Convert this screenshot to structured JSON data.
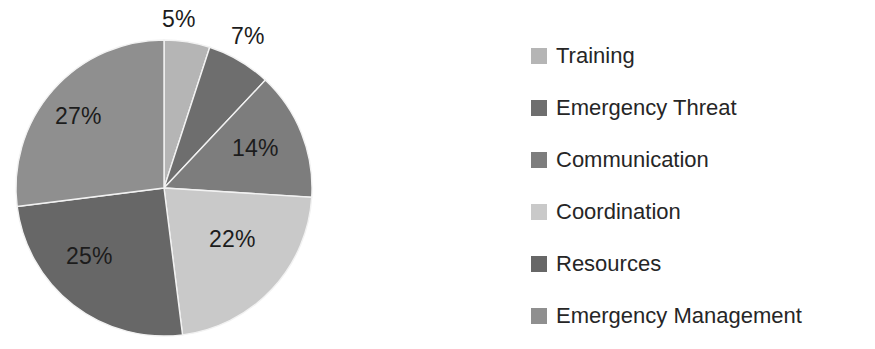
{
  "chart_data": {
    "type": "pie",
    "title": "",
    "categories": [
      "Training",
      "Emergency Threat",
      "Communication",
      "Coordination",
      "Resources",
      "Emergency Management"
    ],
    "values": [
      5,
      7,
      14,
      22,
      25,
      27
    ],
    "value_labels": [
      "5%",
      "7%",
      "14%",
      "22%",
      "25%",
      "27%"
    ],
    "unit": "%",
    "legend_position": "right",
    "grid": false,
    "colors": [
      "#b5b5b5",
      "#6e6e6e",
      "#7d7d7d",
      "#c9c9c9",
      "#676767",
      "#8f8f8f"
    ]
  },
  "pie": {
    "center_x": 164,
    "center_y": 188,
    "radius": 148,
    "slices": [
      {
        "name": "Training",
        "label": "5%",
        "value": 5,
        "color": "#b5b5b5",
        "start_deg": 0,
        "end_deg": 18
      },
      {
        "name": "Emergency Threat",
        "label": "7%",
        "value": 7,
        "color": "#6e6e6e",
        "start_deg": 18,
        "end_deg": 43.2
      },
      {
        "name": "Communication",
        "label": "14%",
        "value": 14,
        "color": "#7d7d7d",
        "start_deg": 43.2,
        "end_deg": 93.6
      },
      {
        "name": "Coordination",
        "label": "22%",
        "value": 22,
        "color": "#c9c9c9",
        "start_deg": 93.6,
        "end_deg": 172.8
      },
      {
        "name": "Resources",
        "label": "25%",
        "value": 25,
        "color": "#676767",
        "start_deg": 172.8,
        "end_deg": 262.8
      },
      {
        "name": "Emergency Management",
        "label": "27%",
        "value": 27,
        "color": "#8f8f8f",
        "start_deg": 262.8,
        "end_deg": 360
      }
    ],
    "labels": [
      {
        "text": "5%",
        "left": 162,
        "top": 8,
        "inside": false
      },
      {
        "text": "7%",
        "left": 231,
        "top": 25,
        "inside": false
      },
      {
        "text": "14%",
        "left": 232,
        "top": 137,
        "inside": true
      },
      {
        "text": "22%",
        "left": 209,
        "top": 228,
        "inside": true
      },
      {
        "text": "25%",
        "left": 66,
        "top": 245,
        "inside": true
      },
      {
        "text": "27%",
        "left": 55,
        "top": 105,
        "inside": true
      }
    ]
  },
  "legend": {
    "items": [
      {
        "label": "Training",
        "color": "#b5b5b5"
      },
      {
        "label": "Emergency Threat",
        "color": "#6e6e6e"
      },
      {
        "label": "Communication",
        "color": "#7d7d7d"
      },
      {
        "label": "Coordination",
        "color": "#c9c9c9"
      },
      {
        "label": "Resources",
        "color": "#676767"
      },
      {
        "label": "Emergency Management",
        "color": "#8f8f8f"
      }
    ]
  }
}
